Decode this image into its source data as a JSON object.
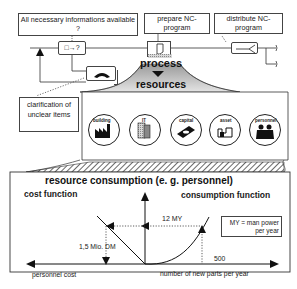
{
  "top_flow": {
    "question_box": "All necessary informations available ?",
    "prepare_box": "prepare NC-program",
    "distribute_box": "distribute NC-program",
    "decision_symbol": "□→?",
    "clarification_box": "clarification of unclear items",
    "process_label": "process",
    "resources_label": "resources"
  },
  "resources": {
    "icons": [
      {
        "label": "building",
        "icon": "factory-icon"
      },
      {
        "label": "IT",
        "icon": "computer-icon"
      },
      {
        "label": "capital",
        "icon": "money-icon"
      },
      {
        "label": "asset",
        "icon": "machine-icon"
      },
      {
        "label": "personnel",
        "icon": "people-icon"
      }
    ]
  },
  "consumption": {
    "title": "resource consumption (e. g. personnel)",
    "cost_function": "cost function",
    "consumption_function": "consumption function",
    "my_value": "12 MY",
    "cost_value": "1,5 Mio. DM",
    "parts_value": "500",
    "legend": "MY = man power per year",
    "x_left_label": "personnel cost",
    "x_right_label": "number of new parts per year"
  },
  "colors": {
    "line": "#222222",
    "hatch": "#555555",
    "shade": "#bdbdbd"
  }
}
